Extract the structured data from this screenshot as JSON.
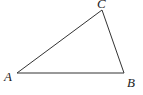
{
  "diagram": {
    "type": "triangle",
    "vertices": [
      {
        "label": "A",
        "x": 17,
        "y": 73,
        "label_x": 4,
        "label_y": 81
      },
      {
        "label": "B",
        "x": 124,
        "y": 73,
        "label_x": 127,
        "label_y": 87
      },
      {
        "label": "C",
        "x": 102,
        "y": 10,
        "label_x": 97,
        "label_y": 8
      }
    ],
    "edges": [
      [
        "A",
        "B"
      ],
      [
        "B",
        "C"
      ],
      [
        "C",
        "A"
      ]
    ],
    "colors": {
      "stroke": "#333333",
      "text": "#222222",
      "background": "#ffffff"
    }
  }
}
